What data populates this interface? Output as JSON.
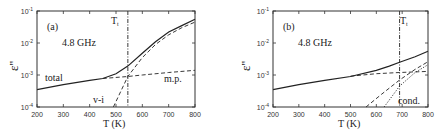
{
  "chart_data": [
    {
      "type": "line",
      "panel": "(a)",
      "annotation": "4.8 GHz",
      "xlabel": "T  (K)",
      "ylabel": "ε''",
      "xlim": [
        200,
        800
      ],
      "ylim": [
        0.0001,
        0.1
      ],
      "yscale": "log",
      "xticks": [
        200,
        300,
        400,
        500,
        600,
        700,
        800
      ],
      "yticks": [
        "10^-4",
        "10^-3",
        "10^-2",
        "10^-1"
      ],
      "vline": {
        "label": "T_t",
        "x": 545
      },
      "series": [
        {
          "name": "total",
          "style": "solid",
          "x": [
            200,
            300,
            400,
            450,
            500,
            545,
            600,
            650,
            700,
            750,
            800
          ],
          "y": [
            0.00035,
            0.0005,
            0.00068,
            0.00078,
            0.0011,
            0.0019,
            0.0048,
            0.011,
            0.022,
            0.035,
            0.055
          ]
        },
        {
          "name": "m.p.",
          "style": "dashed",
          "x": [
            450,
            545,
            600,
            700,
            800
          ],
          "y": [
            0.00078,
            0.0009,
            0.001,
            0.0012,
            0.0014
          ]
        },
        {
          "name": "v-i",
          "style": "dashed",
          "x": [
            490,
            545,
            600,
            650,
            700,
            750,
            800
          ],
          "y": [
            0.0001,
            0.0009,
            0.0035,
            0.009,
            0.018,
            0.03,
            0.045
          ]
        }
      ],
      "labels": {
        "total": "total",
        "mp": "m.p.",
        "vi": "v-i",
        "tt": "T"
      }
    },
    {
      "type": "line",
      "panel": "(b)",
      "annotation": "4.8 GHz",
      "xlabel": "T  (K)",
      "ylabel": "ε''",
      "xlim": [
        200,
        800
      ],
      "ylim": [
        0.0001,
        0.1
      ],
      "yscale": "log",
      "xticks": [
        200,
        300,
        400,
        500,
        600,
        700,
        800
      ],
      "yticks": [
        "10^-4",
        "10^-3",
        "10^-2",
        "10^-1"
      ],
      "vline": {
        "label": "T_t",
        "x": 690
      },
      "series": [
        {
          "name": "total",
          "style": "solid",
          "x": [
            200,
            300,
            400,
            500,
            600,
            650,
            690,
            750,
            800
          ],
          "y": [
            0.00035,
            0.0005,
            0.00068,
            0.0009,
            0.0014,
            0.0019,
            0.0025,
            0.0037,
            0.0055
          ]
        },
        {
          "name": "m.p.",
          "style": "dashed",
          "x": [
            500,
            600,
            690,
            800
          ],
          "y": [
            0.00092,
            0.0011,
            0.0012,
            0.0013
          ]
        },
        {
          "name": "v-i",
          "style": "dashed",
          "x": [
            560,
            620,
            690,
            750,
            800
          ],
          "y": [
            0.0001,
            0.00025,
            0.0007,
            0.0015,
            0.0026
          ]
        },
        {
          "name": "cond.",
          "style": "dotted",
          "x": [
            630,
            690,
            750,
            800
          ],
          "y": [
            0.0001,
            0.00045,
            0.0012,
            0.0021
          ]
        }
      ],
      "labels": {
        "cond": "cond.",
        "tt": "T"
      }
    }
  ],
  "panels": {
    "a": {
      "label": "(a)",
      "freq": "4.8 GHz",
      "xlabel": "T  (K)",
      "ylabel": "ε''",
      "tt": "T",
      "tt_sub": "t",
      "total": "total",
      "mp": "m.p.",
      "vi": "v-i"
    },
    "b": {
      "label": "(b)",
      "freq": "4.8 GHz",
      "xlabel": "T  (K)",
      "ylabel": "ε''",
      "tt": "T",
      "tt_sub": "t",
      "cond": "cond."
    }
  },
  "xtick_labels": [
    "200",
    "300",
    "400",
    "500",
    "600",
    "700",
    "800"
  ],
  "ytick_base": "10",
  "ytick_exps": [
    "-4",
    "-3",
    "-2",
    "-1"
  ]
}
